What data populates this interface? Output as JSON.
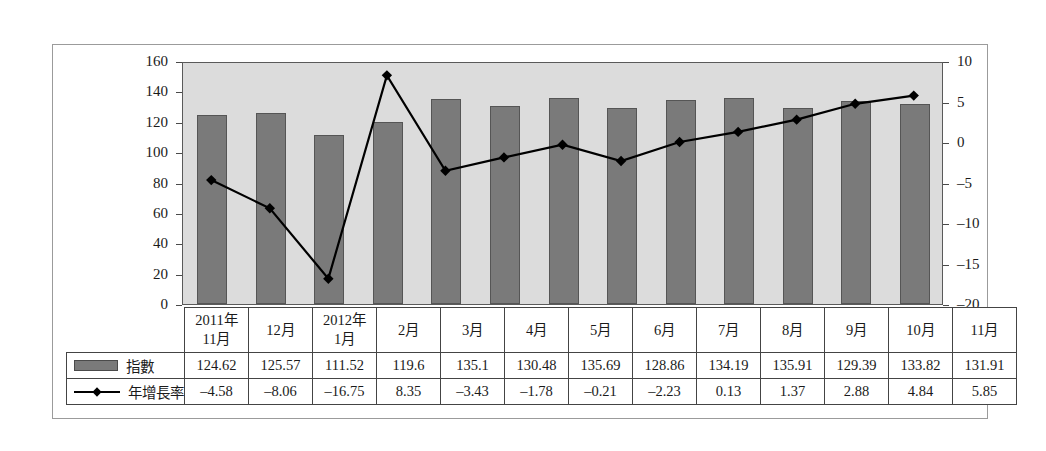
{
  "chart_data": {
    "type": "bar",
    "title": "",
    "subtitle": "",
    "xlabel": "",
    "ylabel": "",
    "grid": false,
    "legend_position": "table-left",
    "categories": [
      "2011年\n11月",
      "12月",
      "2012年\n1月",
      "2月",
      "3月",
      "4月",
      "5月",
      "6月",
      "7月",
      "8月",
      "9月",
      "10月",
      "11月"
    ],
    "axes": {
      "left": {
        "label": "",
        "ylim": [
          0,
          160
        ],
        "ticks": [
          0,
          20,
          40,
          60,
          80,
          100,
          120,
          140,
          160
        ],
        "tick_labels": [
          "0",
          "20",
          "40",
          "60",
          "80",
          "100",
          "120",
          "140",
          "160"
        ]
      },
      "right": {
        "label": "",
        "ylim": [
          -20,
          10
        ],
        "ticks": [
          -20,
          -15,
          -10,
          -5,
          0,
          5,
          10
        ],
        "tick_labels": [
          "-20",
          "-15",
          "-10",
          "-5",
          "0",
          "5",
          "10"
        ]
      }
    },
    "series": [
      {
        "name": "指數",
        "type": "bar",
        "axis": "left",
        "color": "#7a7a7a",
        "values": [
          124.62,
          125.57,
          111.52,
          119.6,
          135.1,
          130.48,
          135.69,
          128.86,
          134.19,
          135.91,
          129.39,
          133.82,
          131.91
        ]
      },
      {
        "name": "年增長率",
        "type": "line",
        "axis": "right",
        "color": "#000000",
        "marker": "diamond",
        "values": [
          -4.58,
          -8.06,
          -16.75,
          8.35,
          -3.43,
          -1.78,
          -0.21,
          -2.23,
          0.13,
          1.37,
          2.88,
          4.84,
          5.85
        ]
      }
    ]
  },
  "table": {
    "header_blank": "",
    "rows": [
      {
        "legend_label": "指數",
        "legend_icon": "bar-swatch-icon",
        "values": [
          "124.62",
          "125.57",
          "111.52",
          "119.6",
          "135.1",
          "130.48",
          "135.69",
          "128.86",
          "134.19",
          "135.91",
          "129.39",
          "133.82",
          "131.91"
        ]
      },
      {
        "legend_label": "年增長率",
        "legend_icon": "line-marker-icon",
        "values": [
          "-4.58",
          "-8.06",
          "-16.75",
          "8.35",
          "-3.43",
          "-1.78",
          "-0.21",
          "-2.23",
          "0.13",
          "1.37",
          "2.88",
          "4.84",
          "5.85"
        ]
      }
    ],
    "headers": [
      {
        "line1": "2011年",
        "line2": "11月"
      },
      {
        "line1": "12月",
        "line2": ""
      },
      {
        "line1": "2012年",
        "line2": "1月"
      },
      {
        "line1": "2月",
        "line2": ""
      },
      {
        "line1": "3月",
        "line2": ""
      },
      {
        "line1": "4月",
        "line2": ""
      },
      {
        "line1": "5月",
        "line2": ""
      },
      {
        "line1": "6月",
        "line2": ""
      },
      {
        "line1": "7月",
        "line2": ""
      },
      {
        "line1": "8月",
        "line2": ""
      },
      {
        "line1": "9月",
        "line2": ""
      },
      {
        "line1": "10月",
        "line2": ""
      },
      {
        "line1": "11月",
        "line2": ""
      }
    ]
  },
  "colors": {
    "plot_background": "#dcdcdc",
    "bar_fill": "#7a7a7a",
    "line": "#000000",
    "frame": "#9b9b9b",
    "axis": "#5a5a5a"
  }
}
